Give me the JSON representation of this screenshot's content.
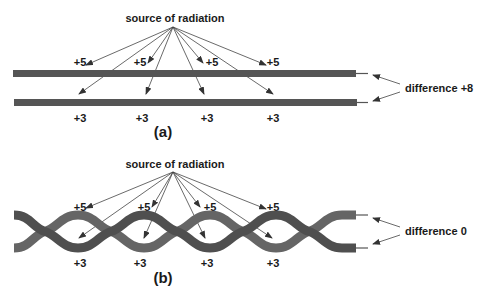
{
  "diagram": {
    "panel_a": {
      "caption": "(a)",
      "source_label": "source of radiation",
      "top_wire_labels": [
        "+5",
        "+5",
        "+5",
        "+5"
      ],
      "bottom_wire_labels": [
        "+3",
        "+3",
        "+3",
        "+3"
      ],
      "difference_label": "difference +8",
      "wire_type": "parallel"
    },
    "panel_b": {
      "caption": "(b)",
      "source_label": "source of radiation",
      "top_wire_labels": [
        "+5",
        "+5",
        "+5",
        "+5"
      ],
      "bottom_wire_labels": [
        "+3",
        "+3",
        "+3",
        "+3"
      ],
      "difference_label": "difference 0",
      "wire_type": "twisted pair"
    },
    "colors": {
      "wire_dark": "#4f4f4f",
      "wire_light": "#656565",
      "arrow": "#444444",
      "text": "#1a1a1a"
    }
  }
}
